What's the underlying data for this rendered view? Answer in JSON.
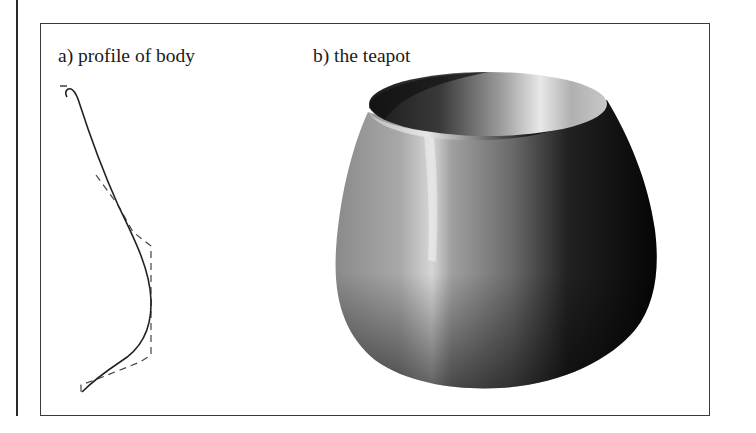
{
  "figure": {
    "panels": [
      {
        "id": "a",
        "caption": "a) profile of body",
        "content": "Bezier profile curve (solid) with dashed control polygon"
      },
      {
        "id": "b",
        "caption": "b) the teapot",
        "content": "Shaded surface of revolution (teapot body)"
      }
    ]
  },
  "colors": {
    "background": "#ffffff",
    "frame": "#3a3a3a",
    "curve": "#222222",
    "control_polygon": "#444444",
    "highlight": "#f2f2f2",
    "shadow": "#050505"
  }
}
